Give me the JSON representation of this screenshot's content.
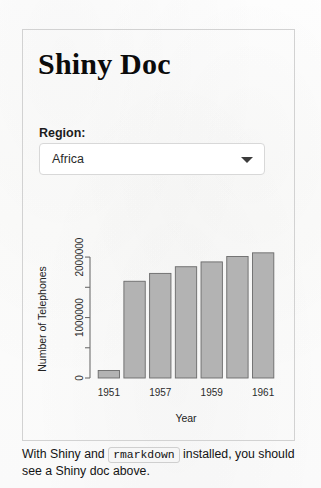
{
  "page": {
    "title": "Shiny Doc",
    "background": "#fdfdfd",
    "card_border_color": "#d2d2d2"
  },
  "controls": {
    "region": {
      "label": "Region:",
      "selected": "Africa",
      "icon": "chevron-down-icon"
    }
  },
  "caption": {
    "before_code": "With Shiny and",
    "code": "rmarkdown",
    "after_code": "installed, you should see a Shiny doc above."
  },
  "chart_data": {
    "type": "bar",
    "title": "",
    "xlabel": "Year",
    "ylabel": "Number of Telephones",
    "categories": [
      "1951",
      "1956",
      "1957",
      "1958",
      "1959",
      "1960",
      "1961"
    ],
    "tick_labels_x": [
      "1951",
      "1957",
      "1959",
      "1961"
    ],
    "tick_label_x_positions": [
      0,
      2,
      4,
      6
    ],
    "values": [
      124000,
      1600000,
      1730000,
      1840000,
      1920000,
      2010000,
      2070000
    ],
    "yticks": [
      0,
      1000000,
      2000000
    ],
    "yticks_minor": [
      500000,
      1500000
    ],
    "ytick_labels": [
      "0",
      "1000000",
      "2000000"
    ],
    "ylim": [
      0,
      2150000
    ],
    "grid": false,
    "legend": "none",
    "bar_fill": "#b3b3b3",
    "bar_stroke": "#6a6a6a"
  }
}
